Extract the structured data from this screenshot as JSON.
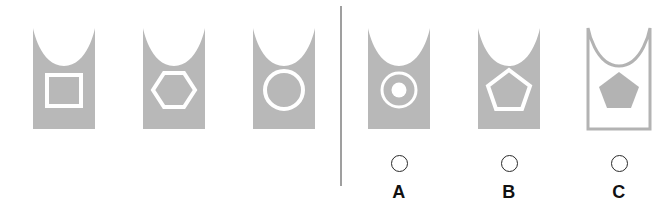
{
  "task": {
    "type": "visual-analogy-matrix",
    "colors": {
      "shape_fill": "#b8b8b8",
      "shape_outline": "#ffffff",
      "card_outline": "#b3b3b3",
      "divider": "#9f9f9f",
      "background": "#ffffff",
      "radio_stroke": "#2a2a2a",
      "label_text": "#111111"
    }
  },
  "left_panel": {
    "name": "sequence-panel",
    "items": [
      {
        "id": "seq-1",
        "card_style": "filled",
        "inner_shape": "square",
        "inner_style": "outline",
        "x": 33,
        "y": 28
      },
      {
        "id": "seq-2",
        "card_style": "filled",
        "inner_shape": "hexagon",
        "inner_style": "outline",
        "x": 143,
        "y": 28
      },
      {
        "id": "seq-3",
        "card_style": "filled",
        "inner_shape": "circle",
        "inner_style": "outline",
        "x": 253,
        "y": 28
      }
    ]
  },
  "right_panel": {
    "name": "answer-options-panel",
    "options": [
      {
        "id": "option-a",
        "label": "A",
        "card_style": "filled",
        "inner_shape": "circle-with-dot",
        "inner_style": "outline",
        "selected": false,
        "x": 368,
        "y": 28,
        "radio_y": 155,
        "label_y": 183
      },
      {
        "id": "option-b",
        "label": "B",
        "card_style": "filled",
        "inner_shape": "pentagon",
        "inner_style": "outline",
        "selected": false,
        "x": 478,
        "y": 28,
        "radio_y": 155,
        "label_y": 183
      },
      {
        "id": "option-c",
        "label": "C",
        "card_style": "outline",
        "inner_shape": "pentagon",
        "inner_style": "filled",
        "selected": false,
        "x": 588,
        "y": 28,
        "radio_y": 155,
        "label_y": 183
      }
    ]
  }
}
